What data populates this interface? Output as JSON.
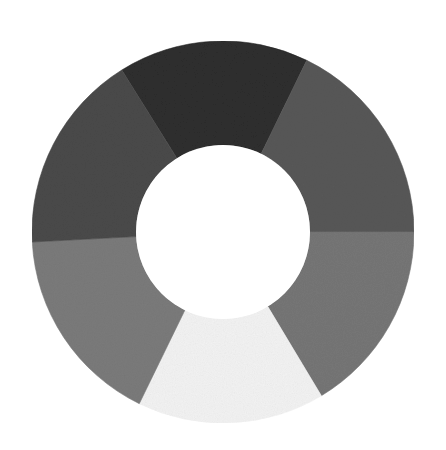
{
  "image": {
    "description": "Grayscale painted donut ring divided into six segments with a white circular hole in the center",
    "width": 446,
    "height": 450,
    "background": "#ffffff"
  },
  "ring": {
    "center": [
      223,
      232
    ],
    "outer_radius": 191,
    "inner_radius": 87,
    "hole_color": "#ffffff",
    "segments": [
      {
        "name": "top",
        "start_deg": -32,
        "end_deg": 26,
        "color": "#2e2e2e"
      },
      {
        "name": "upper-right",
        "start_deg": 26,
        "end_deg": 90,
        "color": "#585858"
      },
      {
        "name": "lower-right",
        "start_deg": 90,
        "end_deg": 149,
        "color": "#767676"
      },
      {
        "name": "bottom",
        "start_deg": 149,
        "end_deg": 206,
        "color": "#f3f3f3"
      },
      {
        "name": "lower-left",
        "start_deg": 206,
        "end_deg": 267,
        "color": "#7b7b7b"
      },
      {
        "name": "upper-left",
        "start_deg": 267,
        "end_deg": 328,
        "color": "#4a4a4a"
      }
    ]
  }
}
